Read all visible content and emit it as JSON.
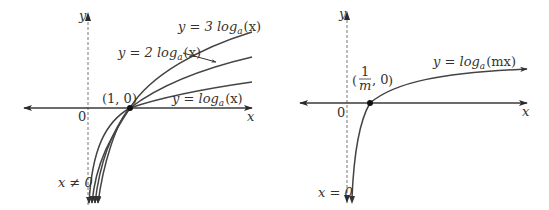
{
  "figure": {
    "left_panel": {
      "axis_labels": {
        "x": "x",
        "y": "y",
        "origin": "0"
      },
      "point": {
        "label": "(1, 0)",
        "x": 1,
        "y": 0
      },
      "asymptote_label": "x ≠ 0",
      "curves": [
        {
          "name": "y = 3 log_a(x)",
          "prefix": "y = 3 log",
          "base": "a",
          "arg": "(x)",
          "multiplier": 3
        },
        {
          "name": "y = 2 log_a(x)",
          "prefix": "y = 2 log",
          "base": "a",
          "arg": "(x)",
          "multiplier": 2
        },
        {
          "name": "y = log_a(x)",
          "prefix": "y = log",
          "base": "a",
          "arg": "(x)",
          "multiplier": 1
        }
      ]
    },
    "right_panel": {
      "axis_labels": {
        "x": "x",
        "y": "y",
        "origin": "0"
      },
      "point": {
        "label_num": "1",
        "label_den": "m",
        "label_rest": ", 0",
        "description": "(1/m, 0)"
      },
      "asymptote_label": "x = 0",
      "curve": {
        "name": "y = log_a(mx)",
        "prefix": "y = log",
        "base": "a",
        "arg": "(mx)"
      }
    },
    "colors": {
      "curve": "#444444",
      "axis": "#3a3a3a",
      "text": "#333333",
      "background": "#ffffff"
    }
  }
}
